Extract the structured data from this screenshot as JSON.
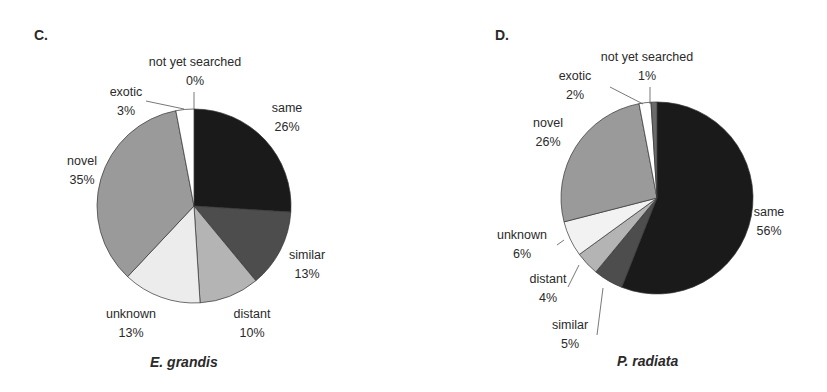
{
  "chart_data": [
    {
      "type": "pie",
      "panel": "C.",
      "title": "E. grandis",
      "start_angle_deg": 0,
      "direction": "clockwise",
      "slices": [
        {
          "label": "same",
          "value": 26,
          "display": "26%",
          "color": "#1a1a1a"
        },
        {
          "label": "similar",
          "value": 13,
          "display": "13%",
          "color": "#4d4d4d"
        },
        {
          "label": "distant",
          "value": 10,
          "display": "10%",
          "color": "#b4b4b4"
        },
        {
          "label": "unknown",
          "value": 13,
          "display": "13%",
          "color": "#ececec"
        },
        {
          "label": "novel",
          "value": 35,
          "display": "35%",
          "color": "#9a9a9a"
        },
        {
          "label": "exotic",
          "value": 3,
          "display": "3%",
          "color": "#ffffff"
        },
        {
          "label": "not yet searched",
          "value": 0,
          "display": "0%",
          "color": "#6a6a6a"
        }
      ]
    },
    {
      "type": "pie",
      "panel": "D.",
      "title": "P. radiata",
      "start_angle_deg": 0,
      "direction": "clockwise",
      "slices": [
        {
          "label": "same",
          "value": 56,
          "display": "56%",
          "color": "#1a1a1a"
        },
        {
          "label": "similar",
          "value": 5,
          "display": "5%",
          "color": "#4d4d4d"
        },
        {
          "label": "distant",
          "value": 4,
          "display": "4%",
          "color": "#b4b4b4"
        },
        {
          "label": "unknown",
          "value": 6,
          "display": "6%",
          "color": "#f2f2f2"
        },
        {
          "label": "novel",
          "value": 26,
          "display": "26%",
          "color": "#9a9a9a"
        },
        {
          "label": "exotic",
          "value": 2,
          "display": "2%",
          "color": "#ffffff"
        },
        {
          "label": "not yet searched",
          "value": 1,
          "display": "1%",
          "color": "#6a6a6a"
        }
      ]
    }
  ],
  "panels": {
    "c": {
      "letter": "C.",
      "caption": "E. grandis",
      "labels": {
        "not_yet_searched": {
          "name": "not yet searched",
          "pct": "0%"
        },
        "exotic": {
          "name": "exotic",
          "pct": "3%"
        },
        "same": {
          "name": "same",
          "pct": "26%"
        },
        "novel": {
          "name": "novel",
          "pct": "35%"
        },
        "similar": {
          "name": "similar",
          "pct": "13%"
        },
        "unknown": {
          "name": "unknown",
          "pct": "13%"
        },
        "distant": {
          "name": "distant",
          "pct": "10%"
        }
      }
    },
    "d": {
      "letter": "D.",
      "caption": "P. radiata",
      "labels": {
        "not_yet_searched": {
          "name": "not yet searched",
          "pct": "1%"
        },
        "exotic": {
          "name": "exotic",
          "pct": "2%"
        },
        "novel": {
          "name": "novel",
          "pct": "26%"
        },
        "same": {
          "name": "same",
          "pct": "56%"
        },
        "unknown": {
          "name": "unknown",
          "pct": "6%"
        },
        "distant": {
          "name": "distant",
          "pct": "4%"
        },
        "similar": {
          "name": "similar",
          "pct": "5%"
        }
      }
    }
  }
}
